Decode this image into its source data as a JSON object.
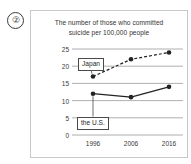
{
  "question_number": "②",
  "chart_data": {
    "type": "line",
    "title": "The number of those who committed suicide per 100,000 people",
    "title_lines": [
      "The number of those who committed",
      "suicide per 100,000 people"
    ],
    "xlabel": "",
    "ylabel": "",
    "categories": [
      "1996",
      "2006",
      "2016"
    ],
    "x": [
      1996,
      2006,
      2016
    ],
    "ylim": [
      0,
      25
    ],
    "yticks": [
      "0",
      "5",
      "10",
      "15",
      "20",
      "25"
    ],
    "ytick_values": [
      0,
      5,
      10,
      15,
      20,
      25
    ],
    "grid": true,
    "legend": "callout-labels",
    "series": [
      {
        "name": "Japan",
        "values": [
          17,
          22,
          24
        ],
        "style": "dashed",
        "marker": "filled-circle",
        "color": "#222222"
      },
      {
        "name": "the U.S.",
        "values": [
          12,
          11,
          14
        ],
        "style": "solid",
        "marker": "filled-circle",
        "color": "#222222"
      }
    ],
    "annotations": [
      {
        "text": "Japan",
        "target_series": "Japan",
        "target_point_index": 0
      },
      {
        "text": "the U.S.",
        "target_series": "the U.S.",
        "target_point_index": 0
      }
    ]
  },
  "colors": {
    "panel_border": "#c9c9c9",
    "gridline": "#9a9a9a",
    "text": "#333333",
    "line": "#222222"
  }
}
